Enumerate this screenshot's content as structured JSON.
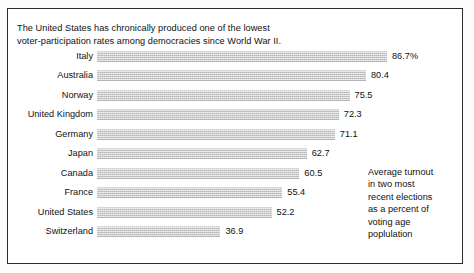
{
  "headline": {
    "lines": [
      "The United States has chronically produced one of the lowest",
      "voter-participation rates among democracies since World War II."
    ]
  },
  "annotation": {
    "lines": [
      "Average turnout",
      "in two most",
      "recent elections",
      "as a percent of",
      "voting age",
      "poplulation"
    ]
  },
  "colors": {
    "bar_fill": "#c9c9c9",
    "frame": "#2b2b2b",
    "text": "#111111",
    "background": "#ffffff"
  },
  "chart_data": {
    "type": "bar",
    "orientation": "horizontal",
    "title": "The United States has chronically produced one of the lowest voter-participation rates among democracies since World War II.",
    "xlabel": "",
    "ylabel": "",
    "xlim": [
      0,
      100
    ],
    "grid": false,
    "legend": null,
    "annotation": "Average turnout in two most recent elections as a percent of voting age poplulation",
    "categories": [
      "Italy",
      "Australia",
      "Norway",
      "United Kingdom",
      "Germany",
      "Japan",
      "Canada",
      "France",
      "United States",
      "Switzerland"
    ],
    "values": [
      86.7,
      80.4,
      75.5,
      72.3,
      71.1,
      62.7,
      60.5,
      55.4,
      52.2,
      36.9
    ],
    "value_labels": [
      "86.7%",
      "80.4",
      "75.5",
      "72.3",
      "71.1",
      "62.7",
      "60.5",
      "55.4",
      "52.2",
      "36.9"
    ],
    "rows": [
      {
        "label": "Italy",
        "value": 86.7,
        "value_label": "86.7%"
      },
      {
        "label": "Australia",
        "value": 80.4,
        "value_label": "80.4"
      },
      {
        "label": "Norway",
        "value": 75.5,
        "value_label": "75.5"
      },
      {
        "label": "United Kingdom",
        "value": 72.3,
        "value_label": "72.3"
      },
      {
        "label": "Germany",
        "value": 71.1,
        "value_label": "71.1"
      },
      {
        "label": "Japan",
        "value": 62.7,
        "value_label": "62.7"
      },
      {
        "label": "Canada",
        "value": 60.5,
        "value_label": "60.5"
      },
      {
        "label": "France",
        "value": 55.4,
        "value_label": "55.4"
      },
      {
        "label": "United States",
        "value": 52.2,
        "value_label": "52.2"
      },
      {
        "label": "Switzerland",
        "value": 36.9,
        "value_label": "36.9"
      }
    ]
  }
}
